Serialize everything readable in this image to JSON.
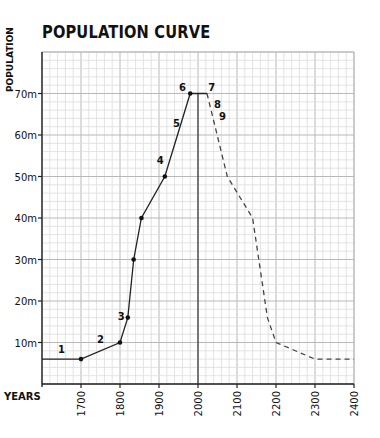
{
  "chart_data": {
    "type": "line",
    "title": "POPULATION CURVE",
    "xlabel": "YEARS",
    "ylabel": "POPULATION",
    "xlim": [
      1600,
      2400
    ],
    "ylim": [
      0,
      80
    ],
    "x_ticks": [
      1700,
      1800,
      1900,
      2000,
      2100,
      2200,
      2300,
      2400
    ],
    "y_ticks": [
      {
        "value": 10,
        "label": "10m"
      },
      {
        "value": 20,
        "label": "20m"
      },
      {
        "value": 30,
        "label": "30m"
      },
      {
        "value": 40,
        "label": "40m"
      },
      {
        "value": 50,
        "label": "50m"
      },
      {
        "value": 60,
        "label": "60m"
      },
      {
        "value": 70,
        "label": "70m"
      }
    ],
    "grid": true,
    "reference_line": {
      "x": 2000,
      "from": 0,
      "to": 70
    },
    "series": [
      {
        "name": "historical",
        "style": "solid",
        "points": [
          [
            1600,
            6
          ],
          [
            1700,
            6
          ],
          [
            1800,
            10
          ],
          [
            1820,
            16
          ],
          [
            1835,
            30
          ],
          [
            1855,
            40
          ],
          [
            1915,
            50
          ],
          [
            1980,
            70
          ],
          [
            2023,
            70
          ]
        ],
        "markers": [
          [
            1700,
            6
          ],
          [
            1800,
            10
          ],
          [
            1820,
            16
          ],
          [
            1835,
            30
          ],
          [
            1855,
            40
          ],
          [
            1915,
            50
          ],
          [
            1980,
            70
          ]
        ]
      },
      {
        "name": "projected",
        "style": "dashed",
        "points": [
          [
            2023,
            70
          ],
          [
            2075,
            50
          ],
          [
            2140,
            40
          ],
          [
            2178,
            16
          ],
          [
            2200,
            10
          ],
          [
            2300,
            6
          ],
          [
            2400,
            6
          ]
        ]
      }
    ],
    "annotations": [
      {
        "text": "1",
        "x": 1650,
        "y": 7.5
      },
      {
        "text": "2",
        "x": 1750,
        "y": 10
      },
      {
        "text": "3",
        "x": 1803,
        "y": 15.5
      },
      {
        "text": "4",
        "x": 1903,
        "y": 53
      },
      {
        "text": "5",
        "x": 1945,
        "y": 62
      },
      {
        "text": "6",
        "x": 1960,
        "y": 70.5
      },
      {
        "text": "7",
        "x": 2035,
        "y": 70.5
      },
      {
        "text": "8",
        "x": 2050,
        "y": 66.5
      },
      {
        "text": "9",
        "x": 2063,
        "y": 63.5
      }
    ]
  }
}
